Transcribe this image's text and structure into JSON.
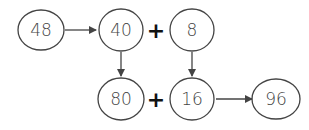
{
  "diagram": {
    "colors": {
      "stroke": "#444444",
      "text": "#444444",
      "operator": "#111111",
      "background": "#ffffff"
    },
    "nodes": [
      {
        "id": "n48",
        "label": "48",
        "cx": 41,
        "cy": 30
      },
      {
        "id": "n40",
        "label": "40",
        "cx": 121,
        "cy": 30
      },
      {
        "id": "n8",
        "label": "8",
        "cx": 192,
        "cy": 30
      },
      {
        "id": "n80",
        "label": "80",
        "cx": 121,
        "cy": 99
      },
      {
        "id": "n16",
        "label": "16",
        "cx": 192,
        "cy": 99
      },
      {
        "id": "n96",
        "label": "96",
        "cx": 276,
        "cy": 99
      }
    ],
    "operators": [
      {
        "id": "plus-top",
        "label": "+",
        "x": 156,
        "y": 38
      },
      {
        "id": "plus-bottom",
        "label": "+",
        "x": 156,
        "y": 107
      }
    ],
    "arrows": [
      {
        "from": "n48",
        "to": "n40",
        "direction": "right"
      },
      {
        "from": "n40",
        "to": "n80",
        "direction": "down"
      },
      {
        "from": "n8",
        "to": "n16",
        "direction": "down"
      },
      {
        "from": "n16",
        "to": "n96",
        "direction": "right"
      }
    ]
  }
}
